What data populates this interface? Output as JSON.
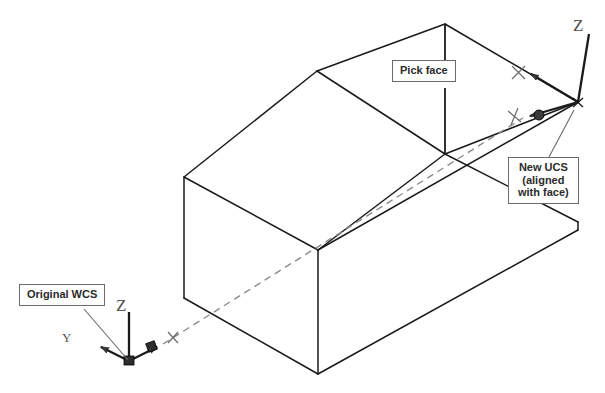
{
  "figure": {
    "background_color": "#ffffff",
    "line_color": "#1a1a1a",
    "dashed_color": "#7a7a7a",
    "label_text_color": "#2b2b2b",
    "label_border_color": "#6b6b6b",
    "width": 605,
    "height": 393
  },
  "callouts": {
    "original_wcs": "Original WCS",
    "pick_face": "Pick face",
    "new_ucs_line1": "New UCS",
    "new_ucs_line2": "(aligned",
    "new_ucs_line3": "with face)",
    "new_ucs_full": "New UCS\n(aligned\nwith face)"
  },
  "wcs_icon": {
    "name": "Original WCS axis icon",
    "origin": {
      "x": 129,
      "y": 361
    },
    "axes": [
      {
        "label": "X",
        "tip": {
          "x": 163,
          "y": 344
        },
        "letter_pos": {
          "x": 174,
          "y": 333
        },
        "arrow": true
      },
      {
        "label": "Y",
        "tip": {
          "x": 92,
          "y": 344
        },
        "letter_pos": {
          "x": 67,
          "y": 338
        },
        "arrow": true
      },
      {
        "label": "Z",
        "tip": {
          "x": 129,
          "y": 312
        },
        "letter_pos": {
          "x": 122,
          "y": 309
        },
        "arrow": false
      }
    ],
    "has_world_box_marker": true
  },
  "ucs_icon": {
    "name": "New UCS axis icon aligned with picked face",
    "origin": {
      "x": 578,
      "y": 102
    },
    "axes": [
      {
        "label": "X",
        "tip": {
          "x": 523,
          "y": 70
        },
        "letter_pos": {
          "x": 517,
          "y": 70
        },
        "arrow": true
      },
      {
        "label": "Y",
        "tip": {
          "x": 521,
          "y": 118
        },
        "letter_pos": {
          "x": 513,
          "y": 120
        },
        "arrow": true
      },
      {
        "label": "Z",
        "tip": {
          "x": 588,
          "y": 31
        },
        "letter_pos": {
          "x": 579,
          "y": 27
        },
        "arrow": false
      }
    ]
  },
  "solid": {
    "name": "Rectangular solid with sloped (chamfered) top face",
    "type": "isometric-wireframe",
    "vertices": {
      "front_top_left": {
        "x": 184,
        "y": 177
      },
      "front_bottom_left": {
        "x": 184,
        "y": 298
      },
      "front_bottom_mid": {
        "x": 318,
        "y": 374
      },
      "front_mid": {
        "x": 318,
        "y": 250
      },
      "ridge_left": {
        "x": 317,
        "y": 71
      },
      "apex": {
        "x": 445,
        "y": 24
      },
      "face_top_right": {
        "x": 578,
        "y": 102
      },
      "mid_right": {
        "x": 445,
        "y": 154
      },
      "bottom_right": {
        "x": 578,
        "y": 222
      },
      "bottom_far_right": {
        "x": 578,
        "y": 230
      }
    },
    "picked_face": {
      "description": "Sloped top-right face of the solid",
      "leader_from": {
        "x": 445,
        "y": 52
      },
      "leader_to": {
        "x": 445,
        "y": 154
      }
    }
  },
  "construction_line": {
    "style": "dashed",
    "from": {
      "x": 163,
      "y": 344
    },
    "to": {
      "x": 523,
      "y": 118
    },
    "description": "Dashed line from WCS X-axis tip to new UCS Y-axis tip"
  },
  "leaders": [
    {
      "name": "original-wcs-leader",
      "from": {
        "x": 85,
        "y": 308
      },
      "to": {
        "x": 129,
        "y": 360
      }
    },
    {
      "name": "pick-face-leader",
      "from": {
        "x": 445,
        "y": 52
      },
      "to": {
        "x": 445,
        "y": 154
      }
    },
    {
      "name": "new-ucs-leader",
      "from": {
        "x": 548,
        "y": 157
      },
      "to": {
        "x": 573,
        "y": 112
      }
    }
  ]
}
